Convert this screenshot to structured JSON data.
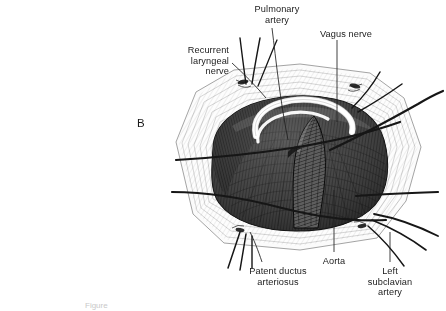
{
  "figure": {
    "panel_letter": "B",
    "background_color": "#ffffff",
    "ink_color": "#1b1b1b",
    "caption_fragment": "Figure"
  },
  "labels": [
    {
      "name": "pulmonary-artery",
      "text": "Pulmonary\nartery",
      "x": 277,
      "y": 4,
      "align": "c"
    },
    {
      "name": "vagus-nerve",
      "text": "Vagus nerve",
      "x": 320,
      "y": 29,
      "align": "l"
    },
    {
      "name": "recurrent-laryngeal-nerve",
      "text": "Recurrent\nlaryngeal\nnerve",
      "x": 229,
      "y": 45,
      "align": "r"
    },
    {
      "name": "patent-ductus-arteriosus",
      "text": "Patent ductus\narteriosus",
      "x": 278,
      "y": 266,
      "align": "c"
    },
    {
      "name": "aorta",
      "text": "Aorta",
      "x": 334,
      "y": 256,
      "align": "c"
    },
    {
      "name": "left-subclavian-artery",
      "text": "Left\nsubclavian\nartery",
      "x": 390,
      "y": 266,
      "align": "c"
    }
  ]
}
